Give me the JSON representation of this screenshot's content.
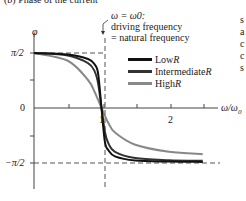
{
  "title": "(b) Phase of the current",
  "annotation": {
    "line1": "ω = ω0:",
    "line2": "driving frequency",
    "line3": "= natural frequency"
  },
  "side_text": [
    "s",
    "a",
    "c",
    "c",
    "s"
  ],
  "colors": {
    "low": "#111111",
    "intermediate": "#333333",
    "high": "#888888",
    "axis": "#444444",
    "dashed": "#555555"
  },
  "chart_data": {
    "type": "line",
    "title": "(b) Phase of the current",
    "xlabel": "ω/ω0",
    "ylabel": "φ",
    "xlim": [
      0,
      2.5
    ],
    "ylim": [
      -1.5708,
      1.5708
    ],
    "x_ticks": [
      0.5,
      1,
      1.5,
      2,
      2.5
    ],
    "x_tick_labels": [
      "",
      "1",
      "",
      "2",
      ""
    ],
    "y_ticks": [
      1.5708,
      0.7854,
      0,
      -0.7854,
      -1.5708
    ],
    "y_tick_labels": [
      "π/2",
      "",
      "0",
      "",
      "−π/2"
    ],
    "grid": false,
    "legend_position": "upper right",
    "reference_lines": [
      {
        "type": "horizontal",
        "y": 1.5708,
        "style": "dashed"
      },
      {
        "type": "horizontal",
        "y": -1.5708,
        "style": "dashed"
      },
      {
        "type": "vertical",
        "x": 1,
        "style": "dashed",
        "label": "ω = ω0: driving frequency = natural frequency"
      }
    ],
    "series": [
      {
        "name": "Low R",
        "x": [
          0,
          0.5,
          0.8,
          0.9,
          0.95,
          1.0,
          1.05,
          1.1,
          1.2,
          1.5,
          2.0,
          2.5
        ],
        "values": [
          1.5708,
          1.53,
          1.4,
          1.24,
          0.98,
          0,
          -0.96,
          -1.2,
          -1.38,
          -1.5,
          -1.53,
          -1.54
        ]
      },
      {
        "name": "Intermediate R",
        "x": [
          0,
          0.5,
          0.8,
          0.9,
          0.95,
          1.0,
          1.05,
          1.1,
          1.2,
          1.5,
          2.0,
          2.5
        ],
        "values": [
          1.5708,
          1.5,
          1.28,
          1.04,
          0.7,
          0,
          -0.68,
          -1.0,
          -1.25,
          -1.43,
          -1.49,
          -1.51
        ]
      },
      {
        "name": "High R",
        "x": [
          0,
          0.5,
          0.8,
          0.9,
          0.95,
          1.0,
          1.05,
          1.1,
          1.2,
          1.5,
          2.0,
          2.5
        ],
        "values": [
          1.5708,
          1.35,
          0.8,
          0.45,
          0.23,
          0,
          -0.22,
          -0.42,
          -0.7,
          -1.05,
          -1.25,
          -1.32
        ]
      }
    ]
  },
  "legend": {
    "items": [
      {
        "label": "Low ",
        "label_r": "R"
      },
      {
        "label": "Intermediate ",
        "label_r": "R"
      },
      {
        "label": "High ",
        "label_r": "R"
      }
    ]
  },
  "axis_labels": {
    "y": "φ",
    "x_num": "ω/ω",
    "x_sub": "0",
    "pi2": "π/2",
    "zero": "0",
    "neg_pi2": "−π/2",
    "one": "1",
    "two": "2"
  }
}
